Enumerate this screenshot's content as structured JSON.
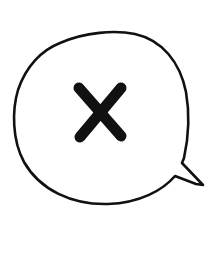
{
  "image": {
    "description": "Hand-drawn speech bubble containing an X mark",
    "background_color": "#ffffff",
    "stroke_color": "#111111"
  },
  "speech_bubble": {
    "icon": "speech-bubble-icon",
    "tail_direction": "bottom-right"
  },
  "mark": {
    "icon": "x-mark-icon",
    "glyph": "✕"
  }
}
